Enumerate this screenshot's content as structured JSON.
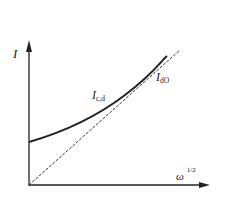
{
  "diagram": {
    "y_axis_label": "I",
    "x_axis_label": "ω",
    "x_axis_exponent": "1/2",
    "curves": [
      {
        "name": "I",
        "subscript": "c,d",
        "style": "solid",
        "description": "Curved line starting at positive intercept, approaching dashed line asymptotically"
      },
      {
        "name": "I",
        "subscript": "dO",
        "style": "dashed",
        "description": "Straight line through origin"
      }
    ],
    "colors": {
      "line": "#222222",
      "background": "#ffffff"
    }
  }
}
